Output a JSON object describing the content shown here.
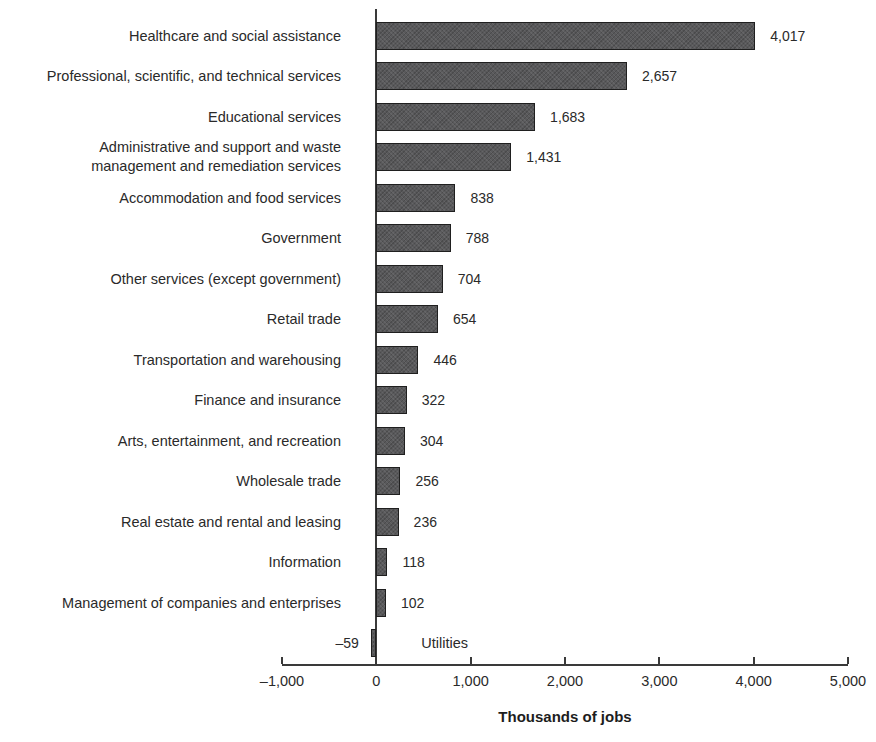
{
  "chart_data": {
    "type": "bar",
    "orientation": "horizontal",
    "title": "",
    "xlabel": "Thousands of jobs",
    "ylabel": "",
    "xlim": [
      -1000,
      5000
    ],
    "grid": false,
    "legend": false,
    "bar_color": "#59595b",
    "bar_border_color": "#1f1f1f",
    "categories": [
      "Healthcare and social assistance",
      "Professional, scientific, and technical services",
      "Educational services",
      "Administrative and support and waste\nmanagement and remediation services",
      "Accommodation and food services",
      "Government",
      "Other services (except government)",
      "Retail trade",
      "Transportation and warehousing",
      "Finance and insurance",
      "Arts, entertainment, and recreation",
      "Wholesale trade",
      "Real estate and rental and leasing",
      "Information",
      "Management of companies and enterprises",
      "Utilities"
    ],
    "values": [
      4017,
      2657,
      1683,
      1431,
      838,
      788,
      704,
      654,
      446,
      322,
      304,
      256,
      236,
      118,
      102,
      -59
    ],
    "value_labels": [
      "4,017",
      "2,657",
      "1,683",
      "1,431",
      "838",
      "788",
      "704",
      "654",
      "446",
      "322",
      "304",
      "256",
      "236",
      "118",
      "102",
      "–59"
    ],
    "x_ticks": [
      {
        "value": -1000,
        "label": "–1,000"
      },
      {
        "value": 0,
        "label": "0"
      },
      {
        "value": 1000,
        "label": "1,000"
      },
      {
        "value": 2000,
        "label": "2,000"
      },
      {
        "value": 3000,
        "label": "3,000"
      },
      {
        "value": 4000,
        "label": "4,000"
      },
      {
        "value": 5000,
        "label": "5,000"
      }
    ]
  }
}
